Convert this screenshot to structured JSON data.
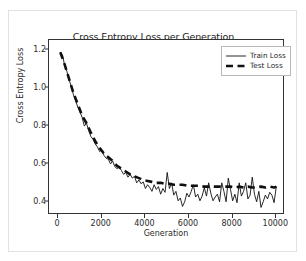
{
  "chart_data": {
    "type": "line",
    "title": "Cross Entropy Loss per Generation",
    "xlabel": "Generation",
    "ylabel": "Cross Entropy Loss",
    "xlim": [
      -420,
      10400
    ],
    "ylim": [
      0.33,
      1.255
    ],
    "grid": false,
    "legend_position": "upper right",
    "xticks": [
      0,
      2000,
      4000,
      6000,
      8000,
      10000
    ],
    "xtick_labels": [
      "0",
      "2000",
      "4000",
      "6000",
      "8000",
      "10000"
    ],
    "yticks": [
      0.4,
      0.6,
      0.8,
      1.0,
      1.2
    ],
    "ytick_labels": [
      "0.4",
      "0.6",
      "0.8",
      "1.0",
      "1.2"
    ],
    "series": [
      {
        "name": "Train Loss",
        "style": "solid",
        "color": "#101010",
        "linewidth": 0.9,
        "x": [
          100,
          200,
          300,
          400,
          500,
          600,
          700,
          800,
          900,
          1000,
          1100,
          1200,
          1300,
          1400,
          1500,
          1600,
          1700,
          1800,
          1900,
          2000,
          2100,
          2200,
          2300,
          2400,
          2500,
          2600,
          2700,
          2800,
          2900,
          3000,
          3100,
          3200,
          3300,
          3400,
          3500,
          3600,
          3700,
          3800,
          3900,
          4000,
          4100,
          4200,
          4300,
          4400,
          4500,
          4600,
          4700,
          4800,
          4900,
          5000,
          5100,
          5200,
          5300,
          5400,
          5500,
          5600,
          5700,
          5800,
          5900,
          6000,
          6100,
          6200,
          6300,
          6400,
          6500,
          6600,
          6700,
          6800,
          6900,
          7000,
          7100,
          7200,
          7300,
          7400,
          7500,
          7600,
          7700,
          7800,
          7900,
          8000,
          8100,
          8200,
          8300,
          8400,
          8500,
          8600,
          8700,
          8800,
          8900,
          9000,
          9100,
          9200,
          9300,
          9400,
          9500,
          9600,
          9700,
          9800,
          9900,
          10000
        ],
        "y": [
          1.19,
          1.175,
          1.12,
          1.09,
          1.045,
          1.01,
          0.965,
          0.935,
          0.9,
          0.875,
          0.845,
          0.8,
          0.815,
          0.775,
          0.745,
          0.73,
          0.705,
          0.69,
          0.665,
          0.675,
          0.645,
          0.63,
          0.625,
          0.6,
          0.615,
          0.585,
          0.575,
          0.585,
          0.565,
          0.545,
          0.555,
          0.53,
          0.545,
          0.525,
          0.535,
          0.5,
          0.515,
          0.495,
          0.505,
          0.47,
          0.49,
          0.475,
          0.455,
          0.49,
          0.465,
          0.48,
          0.44,
          0.47,
          0.45,
          0.555,
          0.47,
          0.5,
          0.435,
          0.455,
          0.405,
          0.42,
          0.375,
          0.4,
          0.445,
          0.425,
          0.455,
          0.49,
          0.425,
          0.44,
          0.405,
          0.43,
          0.475,
          0.43,
          0.5,
          0.445,
          0.405,
          0.425,
          0.44,
          0.4,
          0.5,
          0.455,
          0.4,
          0.525,
          0.465,
          0.405,
          0.44,
          0.395,
          0.5,
          0.43,
          0.455,
          0.5,
          0.415,
          0.435,
          0.53,
          0.44,
          0.4,
          0.455,
          0.37,
          0.4,
          0.435,
          0.415,
          0.45,
          0.435,
          0.395,
          0.48
        ]
      },
      {
        "name": "Test Loss",
        "style": "dashed",
        "color": "#101010",
        "linewidth": 2.6,
        "x": [
          100,
          300,
          500,
          700,
          900,
          1100,
          1300,
          1500,
          1700,
          1900,
          2100,
          2300,
          2500,
          2700,
          2900,
          3100,
          3300,
          3500,
          3700,
          3900,
          4100,
          4300,
          4500,
          4700,
          4900,
          5100,
          5300,
          5500,
          5700,
          5900,
          6100,
          6300,
          6500,
          6700,
          6900,
          7100,
          7300,
          7500,
          7700,
          7900,
          8100,
          8300,
          8500,
          8700,
          8900,
          9100,
          9300,
          9500,
          9700,
          9900,
          10000
        ],
        "y": [
          1.19,
          1.125,
          1.05,
          0.975,
          0.915,
          0.855,
          0.815,
          0.765,
          0.72,
          0.685,
          0.655,
          0.635,
          0.615,
          0.59,
          0.575,
          0.56,
          0.545,
          0.535,
          0.525,
          0.515,
          0.51,
          0.505,
          0.5,
          0.5,
          0.495,
          0.495,
          0.49,
          0.49,
          0.49,
          0.485,
          0.485,
          0.485,
          0.485,
          0.48,
          0.48,
          0.48,
          0.48,
          0.48,
          0.48,
          0.48,
          0.475,
          0.48,
          0.475,
          0.48,
          0.475,
          0.475,
          0.48,
          0.475,
          0.48,
          0.475,
          0.48
        ]
      }
    ]
  },
  "legend": {
    "items": [
      {
        "label": "Train Loss",
        "style": "solid"
      },
      {
        "label": "Test Loss",
        "style": "dashed"
      }
    ]
  }
}
